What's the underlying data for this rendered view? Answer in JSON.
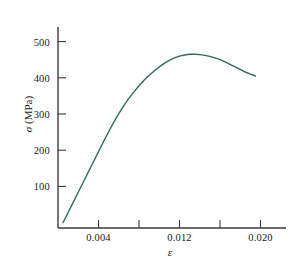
{
  "figure": {
    "background_color": "#ffffff",
    "axis_color": "#3a3a3a",
    "text_color": "#1a1a1a"
  },
  "axis_titles": {
    "y_symbol": "σ",
    "y_units": " (MPa)",
    "y_full": "σ (MPa)",
    "x_full": "ε"
  },
  "y_ticks": [
    {
      "value": 100,
      "label": "100"
    },
    {
      "value": 200,
      "label": "200"
    },
    {
      "value": 300,
      "label": "300"
    },
    {
      "value": 400,
      "label": "400"
    },
    {
      "value": 500,
      "label": "500"
    }
  ],
  "x_ticks": [
    {
      "value": 0.004,
      "label": "0.004",
      "labeled": true
    },
    {
      "value": 0.008,
      "label": "",
      "labeled": false
    },
    {
      "value": 0.012,
      "label": "0.012",
      "labeled": true
    },
    {
      "value": 0.016,
      "label": "",
      "labeled": false
    },
    {
      "value": 0.02,
      "label": "0.020",
      "labeled": true
    }
  ],
  "chart_data": {
    "type": "line",
    "title": "",
    "subtitle": "",
    "xlabel": "ε",
    "ylabel": "σ (MPa)",
    "xlim": [
      0.0,
      0.0225
    ],
    "ylim": [
      -55,
      560
    ],
    "grid": false,
    "legend": null,
    "legend_position": "none",
    "xtick_labels": [
      "0.004",
      "0.012",
      "0.020"
    ],
    "xtick_values": [
      0.004,
      0.012,
      0.02
    ],
    "xtick_minor_values": [
      0.008,
      0.016
    ],
    "ytick_labels": [
      "100",
      "200",
      "300",
      "400",
      "500"
    ],
    "ytick_values": [
      100,
      200,
      300,
      400,
      500
    ],
    "series": [
      {
        "name": "stress-strain curve",
        "color": "#2e6b5e",
        "line_width": 1.4,
        "x": [
          0.0005,
          0.001,
          0.0015,
          0.002,
          0.0025,
          0.003,
          0.0035,
          0.004,
          0.0045,
          0.005,
          0.0055,
          0.006,
          0.0065,
          0.007,
          0.0075,
          0.008,
          0.0085,
          0.009,
          0.0095,
          0.01,
          0.0105,
          0.011,
          0.0115,
          0.012,
          0.0125,
          0.013,
          0.0135,
          0.014,
          0.0145,
          0.015,
          0.0155,
          0.016,
          0.0165,
          0.017,
          0.0175,
          0.018,
          0.0185,
          0.019,
          0.0195
        ],
        "y": [
          0,
          28,
          56,
          84,
          112,
          140,
          168,
          196,
          224,
          251,
          277,
          301,
          323,
          343,
          361,
          378,
          393,
          407,
          419,
          430,
          440,
          448,
          455,
          460,
          463,
          465,
          465,
          464,
          462,
          459,
          455,
          450,
          444,
          437,
          430,
          423,
          416,
          410,
          405
        ]
      }
    ],
    "annotations": [],
    "notes": {
      "peak_stress_MPa": 465,
      "peak_strain": 0.0132,
      "final_stress_MPa": 405,
      "final_strain": 0.0195,
      "elastic_slope_MPa_per_strain": 56000
    }
  }
}
